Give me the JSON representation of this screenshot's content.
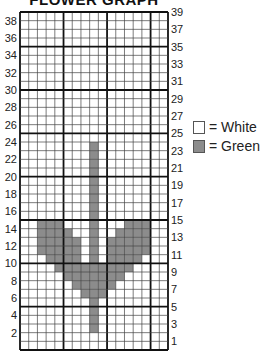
{
  "title": "FLOWER GRAPH",
  "grid": {
    "columns": 17,
    "rows": 39,
    "colors": {
      "white": "#ffffff",
      "green": "#8c8c8c",
      "line": "#111111"
    },
    "filled_cells": {
      "description": "rows numbered 1 (bottom) to 39 (top); columns 1 (left) to 17 (right)",
      "rows": {
        "24": [
          9
        ],
        "23": [
          9
        ],
        "22": [
          9
        ],
        "21": [
          9
        ],
        "20": [
          9
        ],
        "19": [
          9
        ],
        "18": [
          9
        ],
        "17": [
          9
        ],
        "16": [
          9
        ],
        "15": [
          3,
          4,
          5,
          9,
          13,
          14,
          15
        ],
        "14": [
          3,
          4,
          5,
          6,
          9,
          12,
          13,
          14,
          15
        ],
        "13": [
          3,
          4,
          5,
          6,
          7,
          9,
          11,
          12,
          13,
          14,
          15
        ],
        "12": [
          3,
          4,
          5,
          6,
          7,
          9,
          11,
          12,
          13,
          14,
          15
        ],
        "11": [
          4,
          5,
          6,
          7,
          9,
          11,
          12,
          13,
          14
        ],
        "10": [
          5,
          6,
          7,
          8,
          9,
          10,
          11,
          12,
          13
        ],
        "9": [
          6,
          7,
          8,
          9,
          10,
          11,
          12
        ],
        "8": [
          7,
          8,
          9,
          10,
          11
        ],
        "7": [
          8,
          9,
          10
        ],
        "6": [
          9
        ],
        "5": [
          9
        ],
        "4": [
          9
        ],
        "3": [
          9
        ]
      }
    }
  },
  "left_labels": [
    "38",
    "36",
    "34",
    "32",
    "30",
    "28",
    "26",
    "24",
    "22",
    "20",
    "18",
    "16",
    "14",
    "12",
    "10",
    "8",
    "6",
    "4",
    "2"
  ],
  "right_labels": [
    "39",
    "37",
    "35",
    "33",
    "31",
    "29",
    "27",
    "25",
    "23",
    "21",
    "19",
    "17",
    "15",
    "13",
    "11",
    "9",
    "7",
    "5",
    "3",
    "1"
  ],
  "legend": [
    {
      "label": "= White",
      "color": "#ffffff"
    },
    {
      "label": "= Green",
      "color": "#8c8c8c"
    }
  ]
}
